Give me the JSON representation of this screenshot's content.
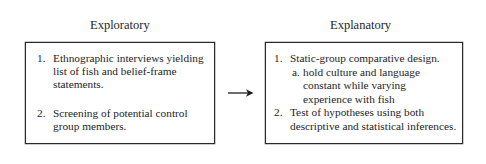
{
  "diagram": {
    "type": "flow",
    "left_panel": {
      "title": "Exploratory",
      "items": [
        {
          "number": "1.",
          "lines": [
            "Ethnographic interviews yielding",
            "list of fish and belief-frame",
            "statements."
          ]
        },
        {
          "number": "2.",
          "lines": [
            "Screening of potential control",
            "group members."
          ]
        }
      ]
    },
    "connector": {
      "direction": "left-to-right",
      "icon": "right-arrow-icon"
    },
    "right_panel": {
      "title": "Explanatory",
      "items": [
        {
          "number": "1.",
          "lines": [
            "Static-group comparative design."
          ],
          "subitems": [
            {
              "letter": "a.",
              "lines": [
                "hold culture and language",
                "constant while varying",
                "experience with fish"
              ]
            }
          ]
        },
        {
          "number": "2.",
          "lines": [
            "Test of hypotheses using both",
            "descriptive and statistical inferences."
          ]
        }
      ]
    },
    "colors": {
      "text": "#1e1e1e",
      "border": "#2a2a2a",
      "background": "#ffffff"
    }
  }
}
